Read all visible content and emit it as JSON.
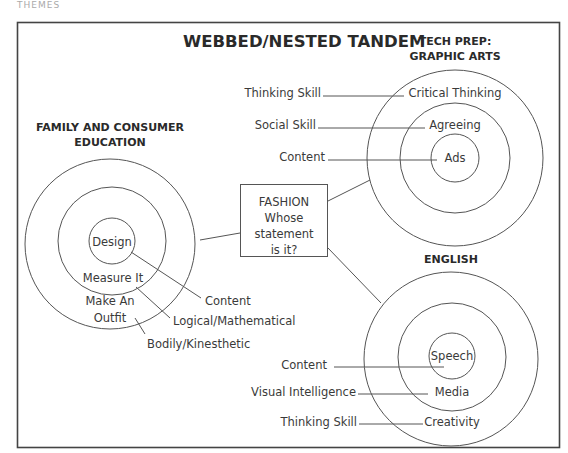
{
  "header": {
    "label": "THEMES"
  },
  "diagram": {
    "title": "WEBBED/NESTED TANDEM",
    "center_box": {
      "lines": [
        "FASHION",
        "Whose",
        "statement",
        "is it?"
      ]
    },
    "tech_prep": {
      "heading": [
        "TECH PREP:",
        "GRAPHIC ARTS"
      ],
      "rings": [
        "Critical Thinking",
        "Agreeing",
        "Ads"
      ],
      "callouts": [
        "Thinking Skill",
        "Social Skill",
        "Content"
      ]
    },
    "family": {
      "heading": [
        "FAMILY AND CONSUMER",
        "EDUCATION"
      ],
      "rings": [
        "Design",
        "Measure It",
        "Make An",
        "Outfit"
      ],
      "callouts": [
        "Content",
        "Logical/Mathematical",
        "Bodily/Kinesthetic"
      ]
    },
    "english": {
      "heading": "ENGLISH",
      "rings": [
        "Speech",
        "Media",
        "Creativity"
      ],
      "callouts": [
        "Content",
        "Visual Intelligence",
        "Thinking Skill"
      ]
    }
  }
}
